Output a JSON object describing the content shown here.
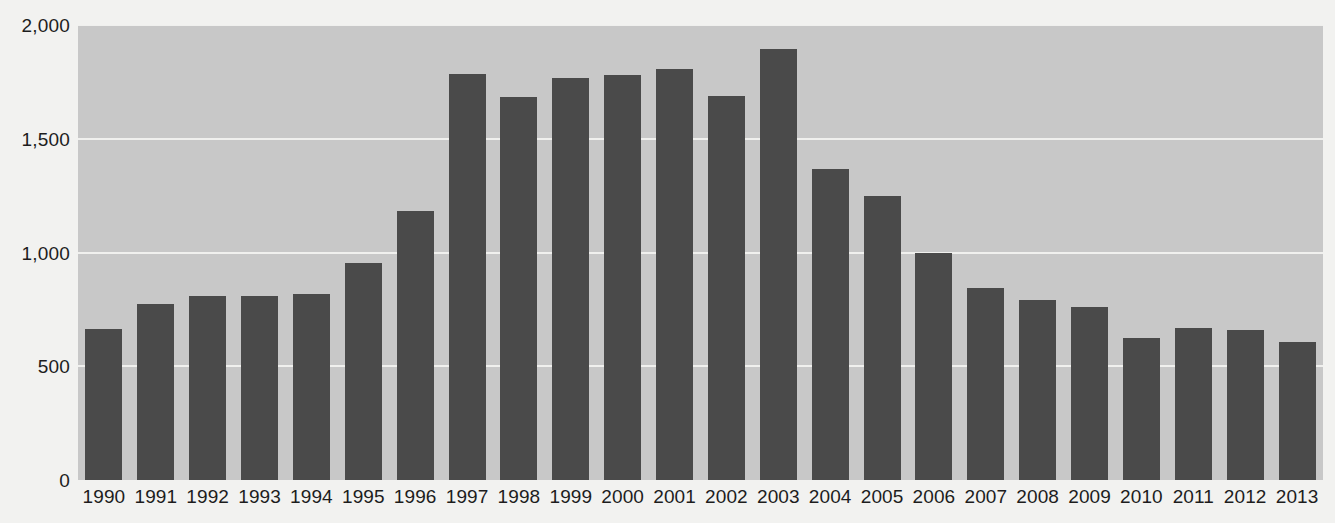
{
  "chart_data": {
    "type": "bar",
    "title": "",
    "subtitle": "",
    "xlabel": "",
    "ylabel": "",
    "categories": [
      "1990",
      "1991",
      "1992",
      "1993",
      "1994",
      "1995",
      "1996",
      "1997",
      "1998",
      "1999",
      "2000",
      "2001",
      "2002",
      "2003",
      "2004",
      "2005",
      "2006",
      "2007",
      "2008",
      "2009",
      "2010",
      "2011",
      "2012",
      "2013"
    ],
    "values": [
      665,
      772,
      807,
      807,
      816,
      956,
      1184,
      1785,
      1684,
      1768,
      1781,
      1807,
      1689,
      1895,
      1368,
      1250,
      996,
      846,
      790,
      759,
      623,
      667,
      658,
      605
    ],
    "series": [
      {
        "name": "",
        "values": [
          665,
          772,
          807,
          807,
          816,
          956,
          1184,
          1785,
          1684,
          1768,
          1781,
          1807,
          1689,
          1895,
          1368,
          1250,
          996,
          846,
          790,
          759,
          623,
          667,
          658,
          605
        ]
      }
    ],
    "ylim": [
      0,
      2000
    ],
    "y_ticks": [
      0,
      500,
      1000,
      1500,
      2000
    ],
    "y_tick_labels": [
      "0",
      "500",
      "1,000",
      "1,500",
      "2,000"
    ],
    "grid": true,
    "grid_axis": "y",
    "legend": false,
    "legend_position": "none",
    "annotations": []
  },
  "style": {
    "bar_color": "#4a4a4a",
    "plot_background": "#c8c8c8",
    "page_background": "#f2f2f0",
    "gridline_color": "#f0f0ee",
    "text_color": "#1d1d1d"
  }
}
